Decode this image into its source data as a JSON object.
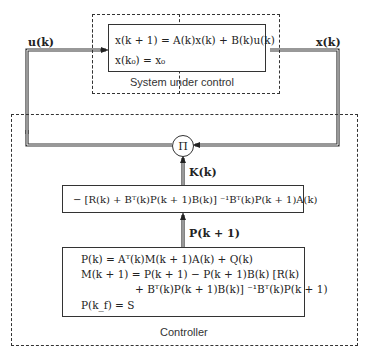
{
  "diagram": {
    "type": "block-diagram",
    "signals": {
      "input": "u(k)",
      "output": "x(k)",
      "gain": "K(k)",
      "riccati": "P(k + 1)"
    },
    "plant": {
      "label": "System under control",
      "equations": [
        "x(k + 1) = A(k)x(k) + B(k)u(k)",
        "x(k₀) = x₀"
      ]
    },
    "multiplier": {
      "symbol": "Π"
    },
    "gain_block": {
      "equation": "− [R(k) + Bᵀ(k)P(k + 1)B(k)] ⁻¹Bᵀ(k)P(k + 1)A(k)"
    },
    "riccati_block": {
      "equations": [
        "P(k) = Aᵀ(k)M(k + 1)A(k) + Q(k)",
        "M(k + 1) = P(k + 1) − P(k + 1)B(k) [R(k)",
        "+ Bᵀ(k)P(k + 1)B(k)] ⁻¹Bᵀ(k)P(k + 1)",
        "P(k_f) = S"
      ]
    },
    "controller": {
      "label": "Controller"
    },
    "colors": {
      "line": "#333333",
      "background": "#ffffff"
    }
  }
}
